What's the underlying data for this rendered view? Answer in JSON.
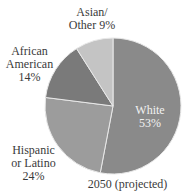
{
  "chart_data": {
    "type": "pie",
    "title": "",
    "caption": "2050 (projected)",
    "slices": [
      {
        "label": "White",
        "value": 53,
        "color": "#8a8a8a"
      },
      {
        "label": "Hispanic or Latino",
        "value": 24,
        "color": "#9c9c9c"
      },
      {
        "label": "African American",
        "value": 14,
        "color": "#7a7a7a"
      },
      {
        "label": "Asian/Other",
        "value": 9,
        "color": "#c4c4c4"
      }
    ]
  },
  "labels": {
    "asian_line1": "Asian/",
    "asian_line2": "Other 9%",
    "african_line1": "African",
    "african_line2": "American",
    "african_line3": "14%",
    "white_line1": "White",
    "white_line2": "53%",
    "hispanic_line1": "Hispanic",
    "hispanic_line2": "or Latino",
    "hispanic_line3": "24%",
    "caption": "2050 (projected)"
  }
}
